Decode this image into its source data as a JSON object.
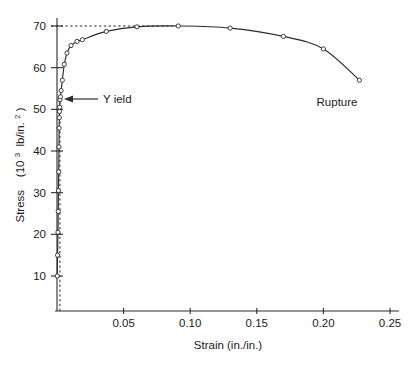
{
  "chart_data": {
    "type": "line",
    "title": "",
    "xlabel": "Strain (in./in.)",
    "ylabel_main": "Stress",
    "ylabel_units": "(10",
    "ylabel_units_sup": "3",
    "ylabel_units_tail": " lb/in.",
    "ylabel_units_sup2": "2",
    "ylabel_units_close": ")",
    "ylabel_full": "Stress  (10^3 lb/in.^2)",
    "xlim": [
      0,
      0.25
    ],
    "ylim": [
      0,
      75
    ],
    "grid": false,
    "legend": null,
    "xticks": [
      0.05,
      0.1,
      0.15,
      0.2,
      0.25
    ],
    "xtick_labels": [
      "0.05",
      "0.10",
      "0.15",
      "0.20",
      "0.25"
    ],
    "yticks": [
      10,
      20,
      30,
      40,
      50,
      60,
      70
    ],
    "ytick_labels": [
      "10",
      "20",
      "30",
      "40",
      "50",
      "60",
      "70"
    ],
    "series": [
      {
        "name": "Stress-strain curve",
        "x": [
          0.0002,
          0.0004,
          0.0007,
          0.0009,
          0.0011,
          0.0013,
          0.0015,
          0.0016,
          0.0018,
          0.0019,
          0.002,
          0.0022,
          0.0026,
          0.0031,
          0.004,
          0.0055,
          0.0075,
          0.0105,
          0.015,
          0.019,
          0.037,
          0.06,
          0.091,
          0.13,
          0.17,
          0.2,
          0.227
        ],
        "y": [
          10.0,
          15.0,
          20.5,
          25.5,
          30.5,
          35.0,
          41.0,
          45.5,
          48.0,
          49.5,
          50.5,
          52.3,
          53.0,
          54.5,
          57.0,
          60.8,
          63.5,
          65.3,
          66.3,
          66.7,
          68.7,
          69.8,
          70.0,
          69.5,
          67.5,
          64.5,
          57.0
        ]
      }
    ],
    "annotations": [
      {
        "name": "yield",
        "label": "Y ield",
        "x": 0.0022,
        "y": 52.3,
        "note": "arrow points left to yield point"
      },
      {
        "name": "rupture",
        "label": "Rupture",
        "x": 0.227,
        "y": 57.0,
        "note": "label placed below final point"
      }
    ],
    "guides": [
      {
        "name": "ultimate-strength-guide",
        "type": "horizontal-dashed",
        "y": 70.0,
        "x_from": 0.0,
        "x_to": 0.091
      },
      {
        "name": "offset-yield-guide",
        "type": "vertical-dashed",
        "x": 0.0022,
        "y_from": 0.0,
        "y_to": 52.3
      }
    ]
  }
}
